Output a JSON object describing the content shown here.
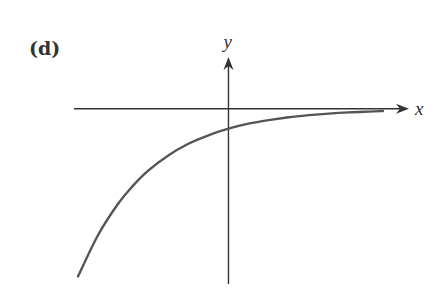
{
  "chart_data": {
    "type": "line",
    "title": "(d)",
    "panel_label": "(d)",
    "xlabel": "x",
    "ylabel": "y",
    "ticks": "none",
    "grid": false,
    "legend": "none",
    "units_note": "Axes carry no numeric ticks; values are in normalized units with y-intercept = -1",
    "xlim": [
      -7.7,
      9.0
    ],
    "ylim": [
      -8.8,
      2.6
    ],
    "series": [
      {
        "name": "curve",
        "function": "y = -exp(-0.284 * x)",
        "x": [
          -7.5,
          -6.5,
          -5.5,
          -4.8,
          -4.0,
          -3.0,
          -2.0,
          -1.0,
          0.0,
          1.0,
          2.0,
          3.0,
          4.0,
          5.0,
          6.0,
          7.0,
          7.7
        ],
        "y": [
          -8.42,
          -6.34,
          -4.77,
          -3.91,
          -3.11,
          -2.34,
          -1.76,
          -1.33,
          -1.0,
          -0.75,
          -0.57,
          -0.43,
          -0.32,
          -0.24,
          -0.18,
          -0.14,
          -0.11
        ]
      }
    ]
  }
}
